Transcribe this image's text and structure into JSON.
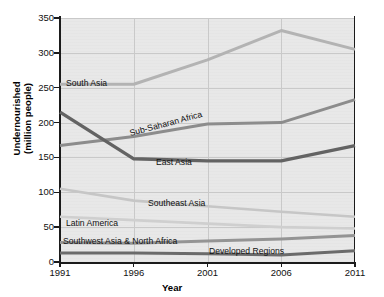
{
  "chart_data": {
    "type": "line",
    "title": "",
    "xlabel": "Year",
    "ylabel": "Undernourished\n(million people)",
    "ylabel_line1": "Undernourished",
    "ylabel_line2": "(million people)",
    "x": [
      1991,
      1996,
      2001,
      2006,
      2011
    ],
    "xticklabels": [
      "1991",
      "1996",
      "2001",
      "2006",
      "2011"
    ],
    "yticks": [
      0,
      50,
      100,
      150,
      200,
      250,
      300,
      350
    ],
    "yticklabels": [
      "0",
      "50",
      "100",
      "150",
      "200",
      "250",
      "300",
      "350"
    ],
    "ylim": [
      0,
      350
    ],
    "grid": true,
    "legend": "inline-labels",
    "series": [
      {
        "name": "South Asia",
        "values": [
          255,
          255,
          290,
          332,
          305
        ],
        "color": "#b3b3b3",
        "width": 3.0,
        "label": {
          "x": 66,
          "y": 79,
          "rotate": 0
        }
      },
      {
        "name": "Sub-Saharan Africa",
        "values": [
          167,
          180,
          198,
          200,
          233
        ],
        "color": "#8c8c8c",
        "width": 3.0,
        "label": {
          "x": 131,
          "y": 129,
          "rotate": -15
        }
      },
      {
        "name": "East Asia",
        "values": [
          215,
          148,
          145,
          145,
          167
        ],
        "color": "#636363",
        "width": 3.4,
        "label": {
          "x": 156,
          "y": 158,
          "rotate": 0
        }
      },
      {
        "name": "Southeast Asia",
        "values": [
          105,
          88,
          80,
          72,
          65
        ],
        "color": "#c6c6c6",
        "width": 2.6,
        "label": {
          "x": 148,
          "y": 199,
          "rotate": 0
        }
      },
      {
        "name": "Latin America",
        "values": [
          65,
          60,
          55,
          50,
          48
        ],
        "color": "#cfcfcf",
        "width": 2.6,
        "label": {
          "x": 66,
          "y": 219,
          "rotate": 0
        }
      },
      {
        "name": "Southwest Asia & North Africa",
        "values": [
          28,
          27,
          30,
          33,
          38
        ],
        "color": "#949494",
        "width": 3.0,
        "label": {
          "x": 63,
          "y": 237,
          "rotate": 0
        }
      },
      {
        "name": "Developed Regions",
        "values": [
          13,
          13,
          12,
          10,
          16
        ],
        "color": "#6b6b6b",
        "width": 3.0,
        "label": {
          "x": 209,
          "y": 247,
          "rotate": 0
        }
      }
    ],
    "colors": {
      "plot_background": "#e8e8e8",
      "gridline": "#c9c9c9",
      "axis": "#1b1b1b",
      "page_background": "#ffffff"
    }
  }
}
